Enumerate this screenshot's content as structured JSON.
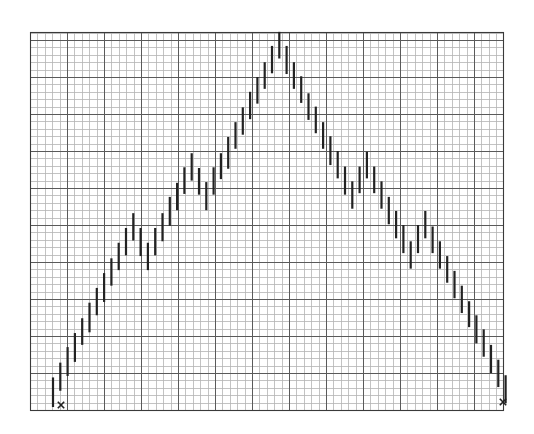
{
  "chart_data": {
    "type": "bar",
    "subtype": "high-low range bars",
    "title": "",
    "xlabel": "",
    "ylabel": "",
    "grid": true,
    "legend": null,
    "grid_spec": {
      "plot_box_px": {
        "left": 30,
        "top": 32,
        "right": 503,
        "bottom": 410
      },
      "minor_spacing_px": 7.4,
      "minor_per_major": 5,
      "minor_color": "#b4b4b4",
      "major_color": "#5a5a5a"
    },
    "units": "minor grid squares from bottom of plot",
    "ylim": [
      0,
      51
    ],
    "bar_start_px": 53,
    "bar_spacing_px": 7.3,
    "bar_color": "#222222",
    "bars": [
      {
        "high": 4.4,
        "low": 0.4
      },
      {
        "high": 6.4,
        "low": 2.6
      },
      {
        "high": 8.5,
        "low": 4.6
      },
      {
        "high": 10.4,
        "low": 6.5
      },
      {
        "high": 12.4,
        "low": 8.8
      },
      {
        "high": 14.5,
        "low": 10.5
      },
      {
        "high": 16.5,
        "low": 12.8
      },
      {
        "high": 18.5,
        "low": 14.6
      },
      {
        "high": 20.5,
        "low": 16.8
      },
      {
        "high": 22.6,
        "low": 18.9
      },
      {
        "high": 24.6,
        "low": 20.9
      },
      {
        "high": 26.6,
        "low": 22.9
      },
      {
        "high": 24.6,
        "low": 20.8
      },
      {
        "high": 22.6,
        "low": 18.9
      },
      {
        "high": 24.6,
        "low": 20.9
      },
      {
        "high": 26.6,
        "low": 22.8
      },
      {
        "high": 28.8,
        "low": 24.9
      },
      {
        "high": 30.7,
        "low": 27.0
      },
      {
        "high": 32.8,
        "low": 29.2
      },
      {
        "high": 34.7,
        "low": 31.0
      },
      {
        "high": 32.7,
        "low": 29.1
      },
      {
        "high": 30.8,
        "low": 27.0
      },
      {
        "high": 32.8,
        "low": 29.1
      },
      {
        "high": 34.7,
        "low": 31.2
      },
      {
        "high": 36.9,
        "low": 32.6
      },
      {
        "high": 38.9,
        "low": 35.3
      },
      {
        "high": 40.9,
        "low": 37.2
      },
      {
        "high": 43.0,
        "low": 39.3
      },
      {
        "high": 45.0,
        "low": 41.4
      },
      {
        "high": 47.0,
        "low": 43.4
      },
      {
        "high": 49.2,
        "low": 45.5
      },
      {
        "high": 51.1,
        "low": 47.5
      },
      {
        "high": 49.2,
        "low": 45.4
      },
      {
        "high": 47.0,
        "low": 43.4
      },
      {
        "high": 45.1,
        "low": 41.5
      },
      {
        "high": 42.8,
        "low": 39.2
      },
      {
        "high": 41.0,
        "low": 37.4
      },
      {
        "high": 38.9,
        "low": 35.3
      },
      {
        "high": 37.0,
        "low": 33.1
      },
      {
        "high": 35.0,
        "low": 31.3
      },
      {
        "high": 32.9,
        "low": 29.1
      },
      {
        "high": 30.9,
        "low": 27.2
      },
      {
        "high": 32.9,
        "low": 29.3
      },
      {
        "high": 34.9,
        "low": 31.3
      },
      {
        "high": 32.9,
        "low": 29.3
      },
      {
        "high": 30.9,
        "low": 27.2
      },
      {
        "high": 28.8,
        "low": 25.1
      },
      {
        "high": 26.9,
        "low": 23.2
      },
      {
        "high": 25.0,
        "low": 21.2
      },
      {
        "high": 22.8,
        "low": 19.1
      },
      {
        "high": 25.0,
        "low": 21.2
      },
      {
        "high": 26.9,
        "low": 23.2
      },
      {
        "high": 24.8,
        "low": 21.2
      },
      {
        "high": 22.8,
        "low": 19.1
      },
      {
        "high": 20.8,
        "low": 17.2
      },
      {
        "high": 18.8,
        "low": 15.1
      },
      {
        "high": 16.8,
        "low": 13.1
      },
      {
        "high": 14.7,
        "low": 11.2
      },
      {
        "high": 12.8,
        "low": 9.0
      },
      {
        "high": 10.9,
        "low": 7.2
      },
      {
        "high": 8.8,
        "low": 5.0
      },
      {
        "high": 6.8,
        "low": 3.1
      },
      {
        "high": 4.7,
        "low": 0.9
      }
    ],
    "annotations": [
      {
        "type": "x-mark",
        "label": "start",
        "x_px": 61,
        "y_px": 405
      },
      {
        "type": "x-mark",
        "label": "end",
        "x_px": 503,
        "y_px": 402
      }
    ]
  }
}
